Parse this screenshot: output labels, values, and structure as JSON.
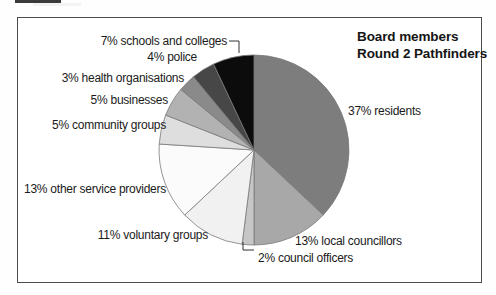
{
  "title": {
    "line1": "Board members",
    "line2": "Round 2 Pathfinders"
  },
  "chart_data": {
    "type": "pie",
    "title_lines": [
      "Board members",
      "Round 2 Pathfinders"
    ],
    "unit": "percent",
    "start_angle_deg": 0,
    "direction": "clockwise",
    "labels_position": "outside",
    "legend": "none",
    "slice_stroke": "#7a7a7a",
    "leader_line_color": "#333333",
    "slices": [
      {
        "id": "residents",
        "name": "residents",
        "value": 37,
        "label": "37% residents",
        "color": "#7d7d7d",
        "leader_line": false
      },
      {
        "id": "local-councillors",
        "name": "local councillors",
        "value": 13,
        "label": "13% local councillors",
        "color": "#a8a8a8",
        "leader_line": false
      },
      {
        "id": "council-officers",
        "name": "council officers",
        "value": 2,
        "label": "2% council officers",
        "color": "#c6c6c6",
        "leader_line": true
      },
      {
        "id": "voluntary-groups",
        "name": "voluntary groups",
        "value": 11,
        "label": "11% voluntary groups",
        "color": "#f1f1f1",
        "leader_line": false
      },
      {
        "id": "other-service-providers",
        "name": "other service providers",
        "value": 13,
        "label": "13% other service providers",
        "color": "#fbfbfb",
        "leader_line": false
      },
      {
        "id": "community-groups",
        "name": "community groups",
        "value": 5,
        "label": "5% community groups",
        "color": "#dedede",
        "leader_line": false
      },
      {
        "id": "businesses",
        "name": "businesses",
        "value": 5,
        "label": "5% businesses",
        "color": "#b2b2b2",
        "leader_line": false
      },
      {
        "id": "health-organisations",
        "name": "health organisations",
        "value": 3,
        "label": "3% health organisations",
        "color": "#8a8a8a",
        "leader_line": false
      },
      {
        "id": "police",
        "name": "police",
        "value": 4,
        "label": "4% police",
        "color": "#474747",
        "leader_line": false
      },
      {
        "id": "schools-and-colleges",
        "name": "schools and colleges",
        "value": 7,
        "label": "7% schools and colleges",
        "color": "#0c0c0c",
        "leader_line": true
      }
    ]
  }
}
